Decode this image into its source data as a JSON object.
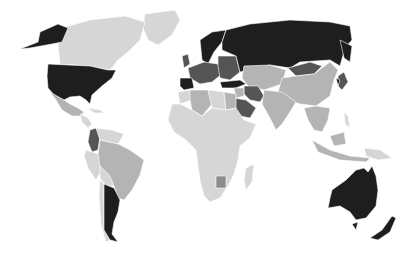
{
  "map": {
    "type": "choropleth",
    "projection": "world",
    "palette": {
      "darkest": "#1e1e1e",
      "dark": "#555555",
      "medium": "#8c8c8c",
      "light": "#b4b4b4",
      "lightest": "#d6d6d6",
      "background": "#ffffff",
      "border": "#ffffff"
    },
    "regions": [
      {
        "name": "Alaska",
        "shade": "darkest"
      },
      {
        "name": "Canada",
        "shade": "lightest"
      },
      {
        "name": "Greenland",
        "shade": "lightest"
      },
      {
        "name": "United States",
        "shade": "darkest"
      },
      {
        "name": "Mexico",
        "shade": "light"
      },
      {
        "name": "Central America",
        "shade": "lightest"
      },
      {
        "name": "Colombia",
        "shade": "dark"
      },
      {
        "name": "Venezuela",
        "shade": "lightest"
      },
      {
        "name": "Brazil",
        "shade": "light"
      },
      {
        "name": "Peru",
        "shade": "lightest"
      },
      {
        "name": "Bolivia",
        "shade": "lightest"
      },
      {
        "name": "Chile",
        "shade": "lightest"
      },
      {
        "name": "Argentina",
        "shade": "darkest"
      },
      {
        "name": "Scandinavia",
        "shade": "darkest"
      },
      {
        "name": "Western Europe",
        "shade": "dark"
      },
      {
        "name": "Spain",
        "shade": "darkest"
      },
      {
        "name": "Eastern Europe",
        "shade": "dark"
      },
      {
        "name": "Russia",
        "shade": "darkest"
      },
      {
        "name": "Turkey",
        "shade": "darkest"
      },
      {
        "name": "Kazakhstan",
        "shade": "light"
      },
      {
        "name": "Mongolia",
        "shade": "dark"
      },
      {
        "name": "China",
        "shade": "light"
      },
      {
        "name": "Japan",
        "shade": "dark"
      },
      {
        "name": "Iran",
        "shade": "dark"
      },
      {
        "name": "Saudi Arabia",
        "shade": "dark"
      },
      {
        "name": "India",
        "shade": "light"
      },
      {
        "name": "Thailand",
        "shade": "dark"
      },
      {
        "name": "Southeast Asia",
        "shade": "light"
      },
      {
        "name": "Indonesia",
        "shade": "light"
      },
      {
        "name": "Algeria",
        "shade": "light"
      },
      {
        "name": "Africa",
        "shade": "lightest"
      },
      {
        "name": "Egypt",
        "shade": "light"
      },
      {
        "name": "Botswana",
        "shade": "medium"
      },
      {
        "name": "Madagascar",
        "shade": "lightest"
      },
      {
        "name": "Australia",
        "shade": "darkest"
      },
      {
        "name": "New Zealand",
        "shade": "darkest"
      }
    ]
  }
}
